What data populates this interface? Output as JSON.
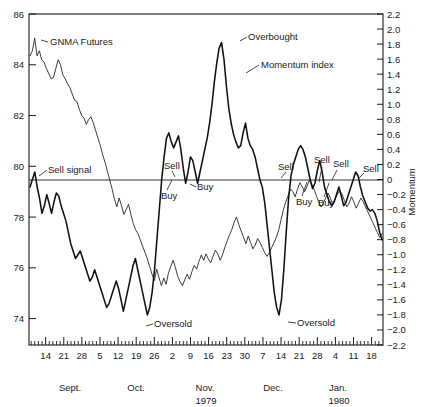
{
  "chart_data": {
    "type": "line",
    "title": "",
    "subtitle": "",
    "xlabel": "",
    "ylabel": "",
    "grid": false,
    "legend": "none",
    "left_axis": {
      "label": "",
      "ticks": [
        86,
        84,
        82,
        80,
        78,
        76,
        74
      ],
      "tick_labels": [
        "86",
        "84",
        "82",
        "80",
        "78",
        "76",
        "74"
      ],
      "ylim": [
        72.96,
        86.0
      ]
    },
    "right_axis": {
      "label": "Momentum",
      "ticks": [
        2.2,
        2.0,
        1.8,
        1.6,
        1.4,
        1.2,
        1.0,
        0.8,
        0.6,
        0.4,
        0.2,
        0,
        -0.2,
        -0.4,
        -0.6,
        -0.8,
        -1.0,
        -1.2,
        -1.4,
        -1.6,
        -1.8,
        -2.0,
        -2.2
      ],
      "tick_labels": [
        "2.2",
        "2.0",
        "1.8",
        "1.6",
        "1.4",
        "1.2",
        "1.0",
        "0.8",
        "0.6",
        "0.4",
        "0.2",
        "0",
        "-0.2",
        "-0.4",
        "-0.6",
        "-0.8",
        "-1.0",
        "-1.2",
        "-1.4",
        "-1.6",
        "-1.8",
        "-2.0",
        "-2.2"
      ],
      "ylim": [
        -2.2,
        2.2
      ]
    },
    "x_axis": {
      "tick_labels": [
        "14",
        "21",
        "28",
        "5",
        "12",
        "19",
        "26",
        "2",
        "9",
        "16",
        "23",
        "30",
        "7",
        "14",
        "21",
        "28",
        "4",
        "11",
        "18"
      ],
      "months": [
        "Sept.",
        "Oct.",
        "Nov.",
        "Dec.",
        "Jan."
      ],
      "years": [
        "1979",
        "1980"
      ]
    },
    "series": [
      {
        "name": "GNMA Futures",
        "axis": "left",
        "style": "thin",
        "values": [
          84.35,
          84.55,
          85.05,
          84.35,
          84.55,
          84.2,
          84.1,
          83.85,
          83.65,
          83.45,
          83.5,
          83.85,
          84.2,
          84.0,
          83.6,
          83.45,
          83.25,
          83.1,
          82.85,
          82.6,
          82.55,
          82.25,
          82.0,
          81.9,
          81.65,
          81.85,
          81.95,
          81.7,
          81.4,
          81.1,
          80.8,
          80.45,
          80.15,
          79.8,
          79.45,
          79.1,
          78.7,
          78.4,
          78.75,
          78.45,
          78.1,
          78.3,
          78.5,
          78.1,
          77.75,
          77.5,
          77.35,
          77.1,
          76.85,
          76.6,
          76.35,
          76.05,
          75.75,
          75.5,
          75.95,
          75.6,
          75.3,
          75.6,
          75.35,
          75.8,
          76.05,
          76.3,
          76.0,
          75.65,
          75.45,
          75.3,
          75.55,
          75.75,
          75.55,
          75.85,
          76.1,
          75.95,
          76.25,
          76.5,
          76.3,
          76.55,
          76.35,
          76.2,
          76.45,
          76.7,
          76.55,
          76.3,
          76.5,
          76.8,
          77.05,
          77.3,
          77.5,
          77.8,
          78.0,
          77.7,
          77.45,
          77.2,
          76.95,
          77.25,
          77.0,
          76.75,
          76.9,
          77.15,
          77.0,
          76.8,
          76.6,
          76.45,
          76.6,
          76.8,
          77.0,
          77.2,
          77.5,
          77.9,
          78.3,
          78.6,
          78.85,
          79.1,
          79.0,
          78.8,
          79.1,
          79.35,
          79.2,
          79.0,
          79.2,
          79.45,
          79.3,
          79.1,
          78.85,
          78.6,
          78.4,
          78.55,
          78.75,
          78.95,
          78.75,
          78.5,
          78.7,
          78.9,
          79.05,
          78.9,
          78.65,
          78.4,
          78.55,
          78.8,
          78.6,
          78.35,
          78.55,
          78.75,
          78.6,
          78.4,
          78.2,
          78.0,
          77.8,
          77.6,
          77.4,
          77.2,
          77.35
        ]
      },
      {
        "name": "Momentum index",
        "axis": "right",
        "style": "thick",
        "values": [
          -0.1,
          0.0,
          0.1,
          -0.1,
          -0.25,
          -0.45,
          -0.35,
          -0.2,
          -0.32,
          -0.45,
          -0.3,
          -0.18,
          -0.22,
          -0.35,
          -0.45,
          -0.55,
          -0.7,
          -0.85,
          -0.95,
          -1.05,
          -1.0,
          -0.95,
          -1.05,
          -1.15,
          -1.25,
          -1.35,
          -1.3,
          -1.2,
          -1.3,
          -1.4,
          -1.5,
          -1.6,
          -1.7,
          -1.65,
          -1.55,
          -1.45,
          -1.35,
          -1.45,
          -1.6,
          -1.75,
          -1.6,
          -1.45,
          -1.3,
          -1.15,
          -1.05,
          -1.2,
          -1.35,
          -1.5,
          -1.65,
          -1.8,
          -1.7,
          -1.5,
          -1.2,
          -0.8,
          -0.4,
          0.0,
          0.3,
          0.55,
          0.62,
          0.5,
          0.42,
          0.5,
          0.58,
          0.4,
          0.15,
          -0.05,
          0.1,
          0.3,
          0.25,
          0.1,
          -0.05,
          0.1,
          0.25,
          0.4,
          0.55,
          0.75,
          1.0,
          1.3,
          1.55,
          1.75,
          1.82,
          1.6,
          1.25,
          0.95,
          0.75,
          0.6,
          0.5,
          0.42,
          0.45,
          0.62,
          0.75,
          0.55,
          0.45,
          0.4,
          0.3,
          0.15,
          0.0,
          -0.1,
          -0.3,
          -0.6,
          -0.9,
          -1.2,
          -1.5,
          -1.7,
          -1.8,
          -1.6,
          -1.2,
          -0.7,
          -0.25,
          0.05,
          0.2,
          0.3,
          0.4,
          0.45,
          0.4,
          0.3,
          0.15,
          0.0,
          -0.12,
          -0.05,
          0.12,
          0.25,
          0.1,
          -0.1,
          -0.2,
          -0.3,
          -0.35,
          -0.3,
          -0.2,
          -0.1,
          -0.22,
          -0.35,
          -0.3,
          -0.2,
          -0.1,
          0.0,
          0.1,
          0.05,
          -0.1,
          -0.22,
          -0.3,
          -0.38,
          -0.42,
          -0.4,
          -0.45,
          -0.55,
          -0.7,
          -0.8
        ]
      }
    ],
    "annotations": [
      {
        "text": "GNMA Futures",
        "name": "gnma-futures-label"
      },
      {
        "text": "Sell signal",
        "name": "sell-signal-label"
      },
      {
        "text": "Oversold",
        "name": "oversold-label-1"
      },
      {
        "text": "Sell",
        "name": "sell-label-1"
      },
      {
        "text": "Buy",
        "name": "buy-label-1"
      },
      {
        "text": "Buy",
        "name": "buy-label-2"
      },
      {
        "text": "Overbought",
        "name": "overbought-label"
      },
      {
        "text": "Momentum index",
        "name": "momentum-index-label"
      },
      {
        "text": "Sell",
        "name": "sell-label-2"
      },
      {
        "text": "Oversold",
        "name": "oversold-label-2"
      },
      {
        "text": "Sell",
        "name": "sell-label-3"
      },
      {
        "text": "Buy",
        "name": "buy-label-3"
      },
      {
        "text": "Sell",
        "name": "sell-label-4"
      },
      {
        "text": "Buy",
        "name": "buy-label-4"
      },
      {
        "text": "Sell",
        "name": "sell-label-5"
      }
    ]
  },
  "axes": {
    "left_ticks": [
      "86",
      "84",
      "82",
      "80",
      "78",
      "76",
      "74"
    ],
    "right_ticks": [
      "2.2",
      "2.0",
      "1.8",
      "1.6",
      "1.4",
      "1.2",
      "1.0",
      "0.8",
      "0.6",
      "0.4",
      "0.2",
      "0",
      "-0.2",
      "-0.4",
      "-0.6",
      "-0.8",
      "-1.0",
      "-1.2",
      "-1.4",
      "-1.6",
      "-1.8",
      "-2.0",
      "-2.2"
    ],
    "x_ticks": [
      "14",
      "21",
      "28",
      "5",
      "12",
      "19",
      "26",
      "2",
      "9",
      "16",
      "23",
      "30",
      "7",
      "14",
      "21",
      "28",
      "4",
      "11",
      "18"
    ],
    "right_axis_title": "Momentum"
  },
  "months": [
    {
      "label": "Sept."
    },
    {
      "label": "Oct."
    },
    {
      "label": "Nov."
    },
    {
      "label": "Dec."
    },
    {
      "label": "Jan."
    }
  ],
  "years": [
    {
      "label": "1979"
    },
    {
      "label": "1980"
    }
  ],
  "annotations": {
    "gnma_futures": "GNMA Futures",
    "sell_signal": "Sell signal",
    "oversold_1": "Oversold",
    "sell_1": "Sell",
    "buy_1": "Buy",
    "buy_2": "Buy",
    "overbought": "Overbought",
    "momentum_index": "Momentum index",
    "sell_2": "Sell",
    "oversold_2": "Oversold",
    "sell_3": "Sell",
    "buy_3": "Buy",
    "sell_4": "Sell",
    "buy_4": "Buy",
    "sell_5": "Sell"
  }
}
